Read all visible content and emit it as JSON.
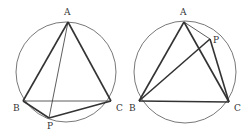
{
  "figures": [
    {
      "name": "left",
      "circle": {
        "cx": 66,
        "cy": 72,
        "r": 50
      },
      "points": {
        "A": [
          68,
          22
        ],
        "B": [
          23,
          101
        ],
        "C": [
          111,
          101
        ],
        "P": [
          49,
          118
        ]
      },
      "labels": {
        "A": "A",
        "B": "B",
        "C": "C",
        "P": "P"
      },
      "label_pos": {
        "A": [
          64,
          15
        ],
        "B": [
          13,
          111
        ],
        "C": [
          116,
          111
        ],
        "P": [
          47,
          129
        ]
      },
      "thick": [
        [
          "A",
          "B"
        ],
        [
          "A",
          "C"
        ],
        [
          "B",
          "P"
        ],
        [
          "P",
          "C"
        ]
      ],
      "thin": [
        [
          "B",
          "C"
        ],
        [
          "A",
          "P"
        ]
      ]
    },
    {
      "name": "right",
      "circle": {
        "cx": 185,
        "cy": 72,
        "r": 51
      },
      "points": {
        "A": [
          184,
          22
        ],
        "B": [
          139,
          101
        ],
        "C": [
          229,
          102
        ],
        "P": [
          210,
          39
        ]
      },
      "labels": {
        "A": "A",
        "B": "B",
        "C": "C",
        "P": "P"
      },
      "label_pos": {
        "A": [
          180,
          15
        ],
        "B": [
          129,
          111
        ],
        "C": [
          234,
          111
        ],
        "P": [
          213,
          43
        ]
      },
      "thick": [
        [
          "A",
          "B"
        ],
        [
          "A",
          "C"
        ],
        [
          "B",
          "C"
        ],
        [
          "B",
          "P"
        ],
        [
          "P",
          "C"
        ]
      ],
      "thin": [
        [
          "A",
          "P"
        ]
      ]
    }
  ],
  "colors": {
    "stroke": "#333333",
    "circle": "#555555"
  }
}
